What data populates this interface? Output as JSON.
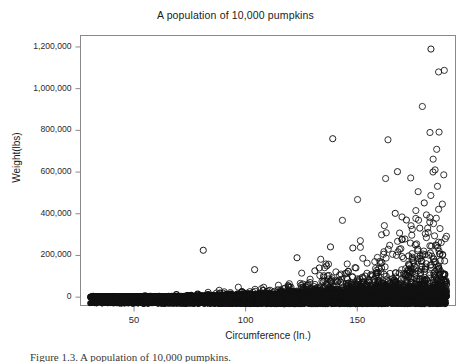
{
  "figure": {
    "caption": "Figure 1.3. A population of 10,000 pumpkins.",
    "background_color": "#ffffff",
    "frame_color": "#808080",
    "marker_color": "#111111"
  },
  "chart_data": {
    "type": "scatter",
    "title": "A population of  10,000 pumpkins",
    "xlabel": "Circumference (In.)",
    "ylabel": "Weight(lbs)",
    "xlim": [
      26,
      194
    ],
    "ylim": [
      -40000,
      1255000
    ],
    "xticks": [
      50,
      100,
      150
    ],
    "xtick_labels": [
      "50",
      "100",
      "150"
    ],
    "yticks": [
      0,
      200000,
      400000,
      600000,
      800000,
      1000000,
      1200000
    ],
    "ytick_labels": [
      "0",
      "200,000",
      "400,000",
      "600,000",
      "800,000",
      "1,000,000",
      "1,200,000"
    ],
    "grid": false,
    "legend": null,
    "n_points": 10000,
    "marker": "open-circle",
    "marker_size": 3.1,
    "notable_outliers": [
      {
        "x": 183,
        "y": 1190000
      },
      {
        "x": 139,
        "y": 760000
      },
      {
        "x": 168,
        "y": 602000
      },
      {
        "x": 180,
        "y": 452000
      },
      {
        "x": 167,
        "y": 402000
      },
      {
        "x": 172,
        "y": 370000
      },
      {
        "x": 178,
        "y": 331000
      },
      {
        "x": 170,
        "y": 276000
      },
      {
        "x": 176,
        "y": 251000
      },
      {
        "x": 138,
        "y": 241000
      },
      {
        "x": 148,
        "y": 236000
      },
      {
        "x": 81,
        "y": 225000
      },
      {
        "x": 187,
        "y": 206000
      },
      {
        "x": 123,
        "y": 189000
      },
      {
        "x": 173,
        "y": 198000
      },
      {
        "x": 161,
        "y": 166000
      },
      {
        "x": 185,
        "y": 170000
      },
      {
        "x": 175,
        "y": 176000
      },
      {
        "x": 179,
        "y": 148000
      },
      {
        "x": 133,
        "y": 140000
      },
      {
        "x": 104,
        "y": 132000
      },
      {
        "x": 131,
        "y": 126000
      },
      {
        "x": 146,
        "y": 124000
      }
    ],
    "band_spans": {
      "x_start": 30,
      "x_end": 190,
      "typical_y": 0,
      "band_half_height": 9000
    }
  }
}
